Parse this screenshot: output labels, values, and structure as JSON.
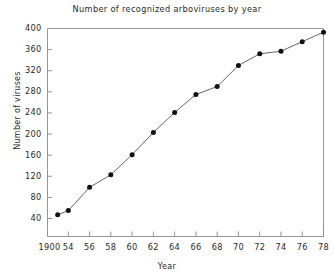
{
  "chart_data": {
    "type": "line",
    "title": "Number of  recognized  arboviruses  by  year",
    "xlabel": "Year",
    "ylabel": "Number  of  viruses",
    "x": [
      1953,
      1954,
      1956,
      1958,
      1960,
      1962,
      1964,
      1966,
      1968,
      1970,
      1972,
      1974,
      1976,
      1978
    ],
    "values": [
      47,
      55,
      99,
      123,
      161,
      203,
      241,
      275,
      290,
      330,
      352,
      357,
      375,
      393
    ],
    "series": [
      {
        "name": "Recognized arboviruses",
        "values": [
          47,
          55,
          99,
          123,
          161,
          203,
          241,
          275,
          290,
          330,
          352,
          357,
          375,
          393
        ]
      }
    ],
    "xlim": [
      1952,
      1978
    ],
    "ylim": [
      20,
      400
    ],
    "yticks": [
      40,
      80,
      120,
      160,
      200,
      240,
      280,
      320,
      360,
      400
    ],
    "ytick_labels": [
      "40",
      "80",
      "120",
      "160",
      "200",
      "240",
      "280",
      "320",
      "360",
      "400"
    ],
    "xticks": [
      1954,
      1956,
      1958,
      1960,
      1962,
      1964,
      1966,
      1968,
      1970,
      1972,
      1974,
      1976,
      1978
    ],
    "xtick_labels": [
      "54",
      "56",
      "58",
      "60",
      "62",
      "64",
      "66",
      "68",
      "70",
      "72",
      "74",
      "76",
      "78"
    ],
    "origin_label": "1900",
    "grid": false,
    "legend": "none",
    "marker": "filled-circle",
    "line_color": "#555555",
    "marker_color": "#111111",
    "axis_color": "#8a8a8a",
    "background": "#ffffff"
  }
}
